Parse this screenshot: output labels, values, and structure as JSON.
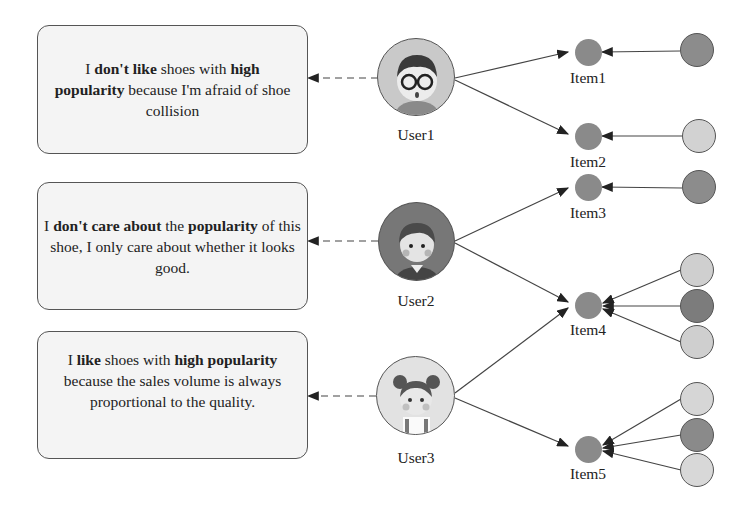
{
  "users": [
    {
      "label": "User1",
      "opinion": [
        {
          "t": "I ",
          "b": false
        },
        {
          "t": "don't like",
          "b": true
        },
        {
          "t": " shoes with ",
          "b": false
        },
        {
          "t": "high popularity",
          "b": true
        },
        {
          "t": " because I'm afraid of shoe collision",
          "b": false
        }
      ]
    },
    {
      "label": "User2",
      "opinion": [
        {
          "t": "I ",
          "b": false
        },
        {
          "t": "don't care about",
          "b": true
        },
        {
          "t": " the ",
          "b": false
        },
        {
          "t": "popularity",
          "b": true
        },
        {
          "t": " of this shoe, I only care about whether it looks good.",
          "b": false
        }
      ]
    },
    {
      "label": "User3",
      "opinion": [
        {
          "t": "I ",
          "b": false
        },
        {
          "t": "like",
          "b": true
        },
        {
          "t": " shoes with ",
          "b": false
        },
        {
          "t": "high popularity",
          "b": true
        },
        {
          "t": " because the sales volume is always proportional to the quality.",
          "b": false
        }
      ]
    }
  ],
  "items": [
    {
      "label": "Item1"
    },
    {
      "label": "Item2"
    },
    {
      "label": "Item3"
    },
    {
      "label": "Item4"
    },
    {
      "label": "Item5"
    }
  ],
  "colors": {
    "item_node": "#8a8a8a",
    "box_bg": "#f4f4f4",
    "edge": "#444444"
  }
}
